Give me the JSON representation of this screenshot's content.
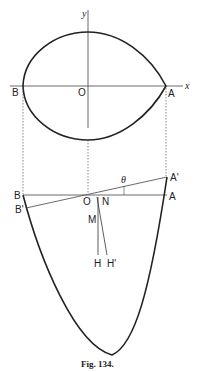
{
  "figure": {
    "caption": "Fig. 134.",
    "top_diagram": {
      "axis_x_label": "x",
      "axis_y_label": "y",
      "point_B": "B",
      "point_O": "O",
      "point_A": "A"
    },
    "bottom_diagram": {
      "point_B": "B",
      "point_B_prime": "B'",
      "point_O": "O",
      "point_N": "N",
      "point_M": "M",
      "point_A": "A",
      "point_A_prime": "A'",
      "point_H": "H",
      "point_H_prime": "H'",
      "angle_label": "θ"
    }
  }
}
